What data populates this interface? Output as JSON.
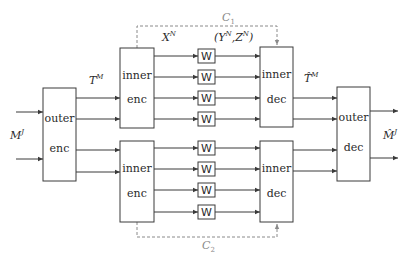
{
  "diagram": {
    "type": "block-diagram",
    "blocks": {
      "outer_enc": {
        "line1": "outer",
        "line2": "enc"
      },
      "inner_enc_top": {
        "line1": "inner",
        "line2": "enc"
      },
      "inner_enc_bottom": {
        "line1": "inner",
        "line2": "enc"
      },
      "inner_dec_top": {
        "line1": "inner",
        "line2": "dec"
      },
      "inner_dec_bottom": {
        "line1": "inner",
        "line2": "dec"
      },
      "outer_dec": {
        "line1": "outer",
        "line2": "dec"
      }
    },
    "channel_label": "W",
    "channels": [
      {
        "group": "top",
        "index": 1,
        "label": "W"
      },
      {
        "group": "top",
        "index": 2,
        "label": "W"
      },
      {
        "group": "top",
        "index": 3,
        "label": "W"
      },
      {
        "group": "top",
        "index": 4,
        "label": "W"
      },
      {
        "group": "bottom",
        "index": 1,
        "label": "W"
      },
      {
        "group": "bottom",
        "index": 2,
        "label": "W"
      },
      {
        "group": "bottom",
        "index": 3,
        "label": "W"
      },
      {
        "group": "bottom",
        "index": 4,
        "label": "W"
      }
    ],
    "labels": {
      "input": {
        "base": "M",
        "sup": "J"
      },
      "t_m": {
        "base": "T",
        "sup": "M"
      },
      "x_n": {
        "base": "X",
        "sup": "N"
      },
      "y_z": {
        "open": "(",
        "y": "Y",
        "y_sup": "N",
        "comma": ",",
        "z": "Z",
        "z_sup": "N",
        "close": ")"
      },
      "t_hat_m": {
        "base": "T̂",
        "sup": "M"
      },
      "output": {
        "base": "M̂",
        "sup": "J"
      },
      "c1": {
        "base": "C",
        "sub": "1"
      },
      "c2": {
        "base": "C",
        "sub": "2"
      }
    },
    "colors": {
      "stroke": "#3a3a3a",
      "dashed": "#8a8a8a",
      "text": "#2a2a2a"
    }
  }
}
